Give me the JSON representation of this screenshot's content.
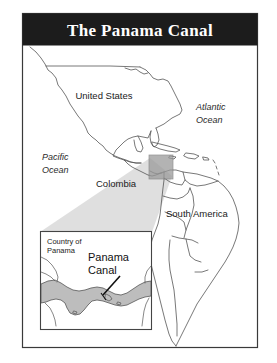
{
  "figure": {
    "title": "The Panama Canal",
    "title_bar_color": "#1c1c1c",
    "title_text_color": "#ffffff",
    "border_color": "#3a3a3a",
    "background_color": "#ffffff",
    "coastline_color": "#555555",
    "highlight_fill": "#9a9a9a",
    "wedge_fill": "#d9d9d9",
    "panama_fill": "#bdbdbd"
  },
  "main_map": {
    "labels": [
      {
        "id": "united-states",
        "text": "United States",
        "style": "upright"
      },
      {
        "id": "atlantic-ocean",
        "line1": "Atlantic",
        "line2": "Ocean",
        "style": "italic"
      },
      {
        "id": "pacific-ocean",
        "line1": "Pacific",
        "line2": "Ocean",
        "style": "italic"
      },
      {
        "id": "colombia",
        "text": "Colombia",
        "style": "upright"
      },
      {
        "id": "south-america",
        "text": "South America",
        "style": "upright"
      }
    ],
    "highlight_box": {
      "label": "panama-highlight"
    }
  },
  "inset_map": {
    "country_label_line1": "Country of",
    "country_label_line2": "Panama",
    "canal_label_line1": "Panama",
    "canal_label_line2": "Canal"
  }
}
